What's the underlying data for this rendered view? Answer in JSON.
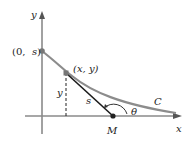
{
  "diagram": {
    "axes": {
      "x_label": "x",
      "y_label": "y"
    },
    "points": {
      "y_intercept": {
        "label_open": "(0, ",
        "label_var": "s",
        "label_close": ")"
      },
      "curve_point": {
        "label": "(x, y)"
      },
      "m_point": {
        "label": "M"
      }
    },
    "segments": {
      "height_label": "y",
      "tangent_label": "s"
    },
    "curve_label": "C",
    "angle_label": "θ",
    "colors": {
      "axis": "#8a8a8a",
      "curve": "#8c8c8c",
      "tangent": "#1a1a1a",
      "text": "#222222"
    }
  }
}
